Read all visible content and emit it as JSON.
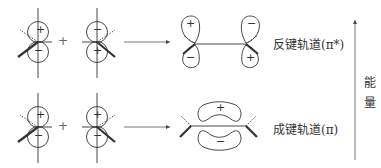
{
  "diagram": {
    "title": "",
    "rows": [
      {
        "id": "antibonding",
        "left_orbital": {
          "top_sign": "+",
          "bottom_sign": "−"
        },
        "operator": "+",
        "right_orbital": {
          "top_sign": "−",
          "bottom_sign": "+"
        },
        "result_lobes": {
          "left_top": "+",
          "left_bottom": "−",
          "right_top": "−",
          "right_bottom": "+"
        },
        "label": "反键轨道(π*)"
      },
      {
        "id": "bonding",
        "left_orbital": {
          "top_sign": "+",
          "bottom_sign": "−"
        },
        "operator": "+",
        "right_orbital": {
          "top_sign": "+",
          "bottom_sign": "−"
        },
        "result_lobes": {
          "top": "+",
          "bottom": "−"
        },
        "label": "成键轨道(π)"
      }
    ],
    "energy_axis": {
      "label_line1": "能",
      "label_line2": "量"
    },
    "colors": {
      "line": "#333333",
      "text": "#333333",
      "arrow": "#555555"
    }
  }
}
